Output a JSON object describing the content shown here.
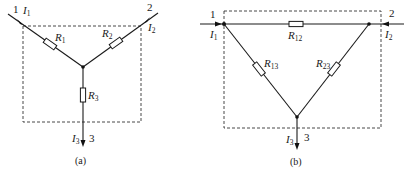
{
  "diagrams": [
    {
      "id": "a",
      "caption": "(a)",
      "topology": "star (Y)",
      "terminals": [
        {
          "num": "1",
          "current": "I",
          "current_sub": "1"
        },
        {
          "num": "2",
          "current": "I",
          "current_sub": "2"
        },
        {
          "num": "3",
          "current": "I",
          "current_sub": "3"
        }
      ],
      "resistors": [
        {
          "name": "R",
          "sub": "1"
        },
        {
          "name": "R",
          "sub": "2"
        },
        {
          "name": "R",
          "sub": "3"
        }
      ]
    },
    {
      "id": "b",
      "caption": "(b)",
      "topology": "delta (Δ)",
      "terminals": [
        {
          "num": "1",
          "current": "I",
          "current_sub": "1"
        },
        {
          "num": "2",
          "current": "I",
          "current_sub": "2"
        },
        {
          "num": "3",
          "current": "I",
          "current_sub": "3"
        }
      ],
      "resistors": [
        {
          "name": "R",
          "sub": "12"
        },
        {
          "name": "R",
          "sub": "13"
        },
        {
          "name": "R",
          "sub": "23"
        }
      ]
    }
  ],
  "colors": {
    "line": "#1a1a1a",
    "background": "#ffffff"
  }
}
